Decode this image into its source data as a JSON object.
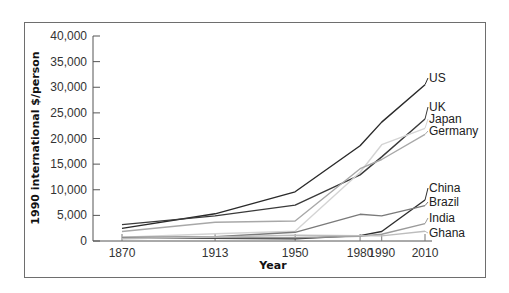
{
  "chart_data": {
    "type": "line",
    "title": "",
    "xlabel": "Year",
    "ylabel": "1990 international $/person",
    "x": [
      1870,
      1913,
      1950,
      1980,
      1990,
      2010
    ],
    "x_tick_labels": [
      "1870",
      "1913",
      "1950",
      "1980",
      "1990",
      "2010"
    ],
    "y_tick_labels": [
      "0",
      "5,000",
      "10,000",
      "15,000",
      "20,000",
      "25,000",
      "30,000",
      "35,000",
      "40,000"
    ],
    "ylim": [
      0,
      40000
    ],
    "xlim": [
      1870,
      2010
    ],
    "grid": false,
    "legend_position": "inline-right",
    "series": [
      {
        "name": "US",
        "color": "#2a2a2a",
        "values": [
          2450,
          5300,
          9600,
          18600,
          23200,
          30500
        ]
      },
      {
        "name": "UK",
        "color": "#3a3a3a",
        "values": [
          3200,
          4900,
          7000,
          12900,
          16400,
          23800
        ]
      },
      {
        "name": "Japan",
        "color": "#d4d4d4",
        "values": [
          740,
          1400,
          1900,
          13400,
          18800,
          22000
        ]
      },
      {
        "name": "Germany",
        "color": "#a8a8a8",
        "values": [
          1850,
          3650,
          3900,
          14100,
          15900,
          20800
        ]
      },
      {
        "name": "China",
        "color": "#2e2e2e",
        "values": [
          530,
          550,
          450,
          1050,
          1850,
          8000
        ]
      },
      {
        "name": "Brazil",
        "color": "#7a7a7a",
        "values": [
          710,
          810,
          1700,
          5200,
          4900,
          6900
        ]
      },
      {
        "name": "India",
        "color": "#9a9a9a",
        "values": [
          530,
          670,
          620,
          940,
          1300,
          3400
        ]
      },
      {
        "name": "Ghana",
        "color": "#bdbdbd",
        "values": [
          440,
          780,
          1120,
          1050,
          1000,
          1900
        ]
      }
    ]
  }
}
